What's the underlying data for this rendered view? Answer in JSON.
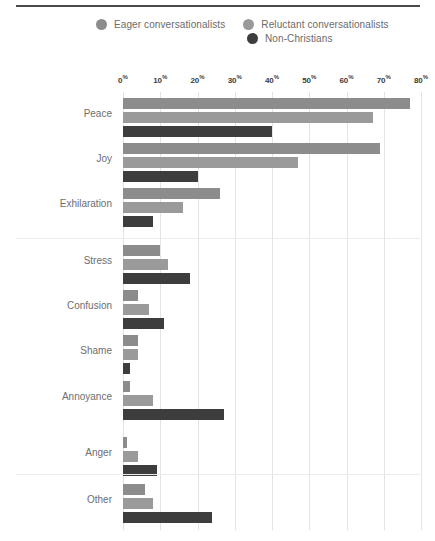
{
  "legend": {
    "items": [
      {
        "label": "Eager conversationalists",
        "color": "#8c8c8c",
        "icon": "circle-icon"
      },
      {
        "label": "Reluctant conversationalists",
        "color": "#9a9a9a",
        "icon": "circle-icon"
      },
      {
        "label": "Non-Christians",
        "color": "#3d3d3d",
        "icon": "circle-icon"
      }
    ]
  },
  "chart_data": {
    "type": "bar",
    "orientation": "horizontal",
    "title": "",
    "subtitle": "",
    "xlabel": "",
    "ylabel": "",
    "xlim": [
      0,
      80
    ],
    "xticks": [
      0,
      10,
      20,
      30,
      40,
      50,
      60,
      70,
      80
    ],
    "xtick_labels": [
      "0%",
      "10%",
      "20%",
      "30%",
      "40%",
      "50%",
      "60%",
      "70%",
      "80%"
    ],
    "grid": true,
    "legend_position": "top",
    "categories": [
      "Peace",
      "Joy",
      "Exhilaration",
      "Stress",
      "Confusion",
      "Shame",
      "Annoyance",
      "Anger",
      "Other"
    ],
    "series": [
      {
        "name": "Eager conversationalists",
        "color": "#8c8c8c",
        "values": [
          77,
          69,
          26,
          10,
          4,
          4,
          2,
          1,
          6
        ]
      },
      {
        "name": "Reluctant conversationalists",
        "color": "#9a9a9a",
        "values": [
          67,
          47,
          16,
          12,
          7,
          4,
          8,
          4,
          8
        ]
      },
      {
        "name": "Non-Christians",
        "color": "#3d3d3d",
        "values": [
          40,
          20,
          8,
          18,
          11,
          2,
          27,
          9,
          24
        ]
      }
    ]
  }
}
